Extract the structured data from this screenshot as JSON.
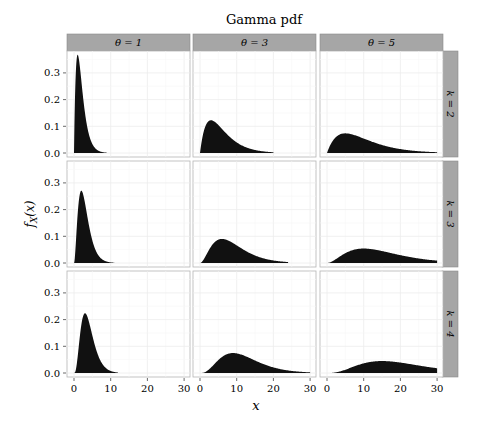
{
  "chart_data": {
    "type": "area",
    "title": "Gamma pdf",
    "xlabel": "x",
    "ylabel": "f_X(x)",
    "xlim": [
      0,
      30
    ],
    "ylim": [
      0,
      0.37
    ],
    "x_ticks": [
      0,
      10,
      20,
      30
    ],
    "y_ticks": [
      0.0,
      0.1,
      0.2,
      0.3
    ],
    "y_tick_labels": [
      "0.0",
      "0.1",
      "0.2",
      "0.3"
    ],
    "grid": true,
    "facet_cols": {
      "name": "θ",
      "labels": [
        "θ = 1",
        "θ = 3",
        "θ = 5"
      ],
      "values": [
        1,
        3,
        5
      ]
    },
    "facet_rows": {
      "name": "k",
      "labels": [
        "k = 2",
        "k = 3",
        "k = 4"
      ],
      "values": [
        2,
        3,
        4
      ]
    },
    "fill_color": "#111111",
    "strip_color": "#a6a6a6",
    "panels": [
      {
        "k": 2,
        "theta": 1,
        "peak_x": 1,
        "peak_y": 0.368,
        "x_range": [
          0,
          9
        ]
      },
      {
        "k": 2,
        "theta": 3,
        "peak_x": 3,
        "peak_y": 0.123,
        "x_range": [
          0,
          20
        ]
      },
      {
        "k": 2,
        "theta": 5,
        "peak_x": 5,
        "peak_y": 0.074,
        "x_range": [
          0,
          30
        ]
      },
      {
        "k": 3,
        "theta": 1,
        "peak_x": 2,
        "peak_y": 0.271,
        "x_range": [
          0,
          11
        ]
      },
      {
        "k": 3,
        "theta": 3,
        "peak_x": 6,
        "peak_y": 0.09,
        "x_range": [
          0,
          24
        ]
      },
      {
        "k": 3,
        "theta": 5,
        "peak_x": 10,
        "peak_y": 0.054,
        "x_range": [
          0,
          30
        ]
      },
      {
        "k": 4,
        "theta": 1,
        "peak_x": 3,
        "peak_y": 0.224,
        "x_range": [
          0,
          12
        ]
      },
      {
        "k": 4,
        "theta": 3,
        "peak_x": 9,
        "peak_y": 0.075,
        "x_range": [
          0,
          30
        ]
      },
      {
        "k": 4,
        "theta": 5,
        "peak_x": 15,
        "peak_y": 0.045,
        "x_range": [
          0,
          30
        ]
      }
    ]
  }
}
